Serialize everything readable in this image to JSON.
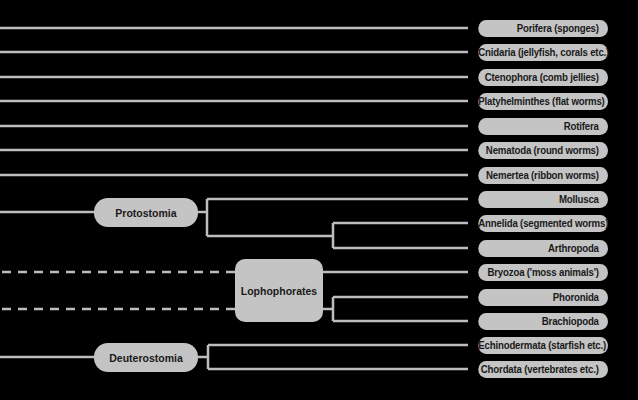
{
  "colors": {
    "background": "#000000",
    "node_fill": "#c4c4c4",
    "line": "#bdbdbd",
    "text": "#1a1a1a"
  },
  "leaves": [
    {
      "label": "Porifera (sponges)"
    },
    {
      "label": "Cnidaria (jellyfish, corals etc.)"
    },
    {
      "label": "Ctenophora (comb jellies)"
    },
    {
      "label": "Platyhelminthes (flat worms)"
    },
    {
      "label": "Rotifera"
    },
    {
      "label": "Nematoda (round worms)"
    },
    {
      "label": "Nemertea (ribbon worms)"
    },
    {
      "label": "Mollusca"
    },
    {
      "label": "Annelida (segmented worms)"
    },
    {
      "label": "Arthropoda"
    },
    {
      "label": "Bryozoa ('moss animals')"
    },
    {
      "label": "Phoronida"
    },
    {
      "label": "Brachiopoda"
    },
    {
      "label": "Echinodermata (starfish etc.)"
    },
    {
      "label": "Chordata (vertebrates etc.)"
    }
  ],
  "clades": {
    "protostomia": {
      "label": "Protostomia",
      "children": [
        "Mollusca",
        "Annelida (segmented worms)",
        "Arthropoda"
      ]
    },
    "lophophorates": {
      "label": "Lophophorates",
      "children": [
        "Bryozoa ('moss animals')",
        "Phoronida",
        "Brachiopoda"
      ],
      "link_style": "dashed"
    },
    "deuterostomia": {
      "label": "Deuterostomia",
      "children": [
        "Echinodermata (starfish etc.)",
        "Chordata (vertebrates etc.)"
      ]
    }
  }
}
